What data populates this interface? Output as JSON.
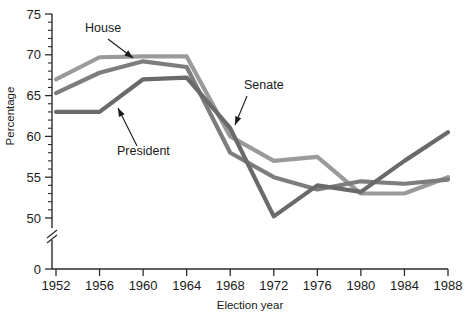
{
  "chart_data": {
    "type": "line",
    "title": "",
    "xlabel": "Election year",
    "ylabel": "Percentage",
    "categories": [
      1952,
      1956,
      1960,
      1964,
      1968,
      1972,
      1976,
      1980,
      1984,
      1988
    ],
    "x_tick_labels": [
      "1952",
      "1956",
      "1960",
      "1964",
      "1968",
      "1972",
      "1976",
      "1980",
      "1984",
      "1988"
    ],
    "y_tick_labels": [
      "0",
      "50",
      "55",
      "60",
      "65",
      "70",
      "75"
    ],
    "y_major_ticks": [
      50,
      55,
      60,
      65,
      70,
      75
    ],
    "y_minor_tick_step": 1,
    "ylim": [
      50,
      75
    ],
    "xlim": [
      1952,
      1988
    ],
    "y_axis_break": true,
    "y_axis_break_label": "0",
    "grid": false,
    "legend_position": "inline-annotations",
    "series": [
      {
        "name": "House",
        "color": "#9a9a9a",
        "values": [
          67.0,
          69.7,
          69.8,
          69.8,
          60.0,
          57.0,
          57.5,
          53.0,
          53.0,
          55.0
        ]
      },
      {
        "name": "Senate",
        "color": "#7d7d7d",
        "values": [
          65.3,
          67.8,
          69.2,
          68.5,
          58.0,
          55.0,
          53.5,
          54.5,
          54.2,
          54.7
        ]
      },
      {
        "name": "President",
        "color": "#6a6a6a",
        "values": [
          63.0,
          63.0,
          67.0,
          67.2,
          61.0,
          50.2,
          54.0,
          53.2,
          57.0,
          60.5
        ]
      }
    ],
    "annotations": [
      {
        "label": "House",
        "text_x": 85,
        "text_y": 32,
        "arrow_from_x": 108,
        "arrow_from_y": 39,
        "arrow_to_x": 133,
        "arrow_to_y": 58
      },
      {
        "label": "President",
        "text_x": 117,
        "text_y": 155,
        "arrow_from_x": 137,
        "arrow_from_y": 146,
        "arrow_to_x": 118,
        "arrow_to_y": 108
      },
      {
        "label": "Senate",
        "text_x": 244,
        "text_y": 89,
        "arrow_from_x": 247,
        "arrow_from_y": 96,
        "arrow_to_x": 235,
        "arrow_to_y": 125
      }
    ]
  }
}
